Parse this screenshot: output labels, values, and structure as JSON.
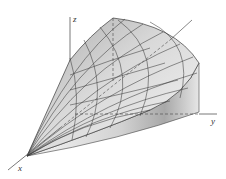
{
  "figure": {
    "axes": {
      "x_label": "x",
      "y_label": "y",
      "z_label": "z"
    },
    "colors": {
      "surface_light": "#f2f2f2",
      "surface_dark": "#b8b8b8",
      "grid_line": "#3a3a3a",
      "axis_line": "#555555",
      "background": "#ffffff"
    }
  }
}
